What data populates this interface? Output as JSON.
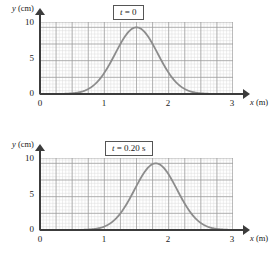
{
  "panels": [
    {
      "title": "t = 0",
      "title_var": "t",
      "title_rest": " = 0",
      "axis": {
        "ylabel_var": "y",
        "ylabel_unit": " (cm)",
        "xlabel_var": "x",
        "xlabel_unit": " (m)",
        "yticks": [
          "0",
          "5",
          "10"
        ],
        "xticks": [
          "0",
          "1",
          "2",
          "3"
        ]
      },
      "chart_data": {
        "type": "line",
        "title": "t = 0",
        "xlabel": "x (m)",
        "ylabel": "y (cm)",
        "xlim": [
          0,
          3
        ],
        "ylim": [
          0,
          10.8
        ],
        "xticks": [
          0,
          1,
          2,
          3
        ],
        "yticks": [
          0,
          5,
          10
        ],
        "grid": true,
        "grid_minor_step_x": 0.05,
        "grid_minor_step_y": 0.5,
        "grid_major_step_x": 0.25,
        "grid_major_step_y": 2.5,
        "legend": "none",
        "series": [
          {
            "name": "pulse at t = 0",
            "shape": "gaussian",
            "peak_x": 1.5,
            "peak_y": 10,
            "width_sigma": 0.33,
            "x": [
              0.0,
              0.1,
              0.2,
              0.3,
              0.4,
              0.5,
              0.6,
              0.7,
              0.8,
              0.9,
              1.0,
              1.1,
              1.2,
              1.3,
              1.4,
              1.5,
              1.6,
              1.7,
              1.8,
              1.9,
              2.0,
              2.1,
              2.2,
              2.3,
              2.4,
              2.5,
              2.6,
              2.7,
              2.8,
              2.9,
              3.0
            ],
            "y": [
              0.0,
              0.0,
              0.01,
              0.03,
              0.09,
              0.23,
              0.53,
              1.1,
              2.05,
              3.44,
              5.2,
              7.0,
              8.5,
              9.55,
              9.95,
              10.0,
              9.95,
              9.55,
              8.5,
              7.0,
              5.2,
              3.44,
              2.05,
              1.1,
              0.53,
              0.23,
              0.09,
              0.03,
              0.01,
              0.0,
              0.0
            ]
          }
        ]
      }
    },
    {
      "title": "t = 0.20 s",
      "title_var": "t",
      "title_rest": " = 0.20 s",
      "axis": {
        "ylabel_var": "y",
        "ylabel_unit": " (cm)",
        "xlabel_var": "x",
        "xlabel_unit": " (m)",
        "yticks": [
          "0",
          "5",
          "10"
        ],
        "xticks": [
          "0",
          "1",
          "2",
          "3"
        ]
      },
      "chart_data": {
        "type": "line",
        "title": "t = 0.20 s",
        "xlabel": "x (m)",
        "ylabel": "y (cm)",
        "xlim": [
          0,
          3
        ],
        "ylim": [
          0,
          10.8
        ],
        "xticks": [
          0,
          1,
          2,
          3
        ],
        "yticks": [
          0,
          5,
          10
        ],
        "grid": true,
        "grid_minor_step_x": 0.05,
        "grid_minor_step_y": 0.5,
        "grid_major_step_x": 0.25,
        "grid_major_step_y": 2.5,
        "legend": "none",
        "series": [
          {
            "name": "pulse at t = 0.20 s",
            "shape": "gaussian",
            "peak_x": 1.8,
            "peak_y": 10,
            "width_sigma": 0.33,
            "x": [
              0.0,
              0.1,
              0.2,
              0.3,
              0.4,
              0.5,
              0.6,
              0.7,
              0.8,
              0.9,
              1.0,
              1.1,
              1.2,
              1.3,
              1.4,
              1.5,
              1.6,
              1.7,
              1.8,
              1.9,
              2.0,
              2.1,
              2.2,
              2.3,
              2.4,
              2.5,
              2.6,
              2.7,
              2.8,
              2.9,
              3.0
            ],
            "y": [
              0.0,
              0.0,
              0.0,
              0.0,
              0.01,
              0.03,
              0.09,
              0.23,
              0.53,
              1.1,
              2.05,
              3.44,
              5.2,
              7.0,
              8.5,
              9.55,
              9.95,
              10.0,
              9.95,
              9.55,
              8.5,
              7.0,
              5.2,
              3.44,
              2.05,
              1.1,
              0.53,
              0.23,
              0.09,
              0.03,
              0.01
            ]
          }
        ]
      }
    }
  ],
  "style": {
    "curve_color": "#8c8c8c",
    "axis_color": "#3c3c3c",
    "grid_minor_color": "#d8d8d8",
    "grid_major_color": "#9a9a9a"
  }
}
